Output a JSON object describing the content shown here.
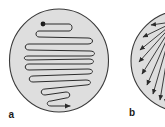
{
  "figure": {
    "panels": [
      {
        "id": "a",
        "label": "a",
        "description": "Circular plate with serpentine zig-zag streak path starting at a dot and ending with an arrow",
        "plate": {
          "cx": 59,
          "cy": 60.5,
          "rx": 49.5,
          "ry": 51.5
        },
        "start_point": {
          "x": 43,
          "y": 24
        }
      },
      {
        "id": "b",
        "label": "b",
        "description": "Circular plate with arrows radiating outward from a point near the right/top edge",
        "plate": {
          "cx": 185,
          "cy": 61,
          "rx": 54,
          "ry": 51
        },
        "arrow_count": 9
      }
    ],
    "colors": {
      "plate_fill": "#dedede",
      "plate_stroke": "#3a3a3a",
      "line": "#2b2b2b",
      "background": "#ffffff"
    }
  }
}
